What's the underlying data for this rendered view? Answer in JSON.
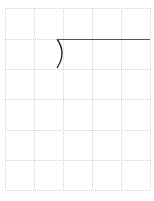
{
  "canvas": {
    "width": 154,
    "height": 201,
    "background": "#ffffff"
  },
  "grid": {
    "color": "#d4d4d4",
    "dash": "1,1",
    "x_lines": [
      5,
      34,
      63,
      92,
      121,
      150
    ],
    "y_lines": [
      8,
      39,
      69,
      99,
      130,
      160,
      190
    ]
  },
  "shapes": {
    "arc": {
      "start": [
        57,
        39
      ],
      "control": [
        67,
        53
      ],
      "end": [
        57,
        68
      ],
      "color": "#1a1a1a",
      "width": 1.3
    },
    "line": {
      "start": [
        57,
        39
      ],
      "end": [
        150,
        39
      ],
      "color": "#555555",
      "width": 1
    }
  }
}
